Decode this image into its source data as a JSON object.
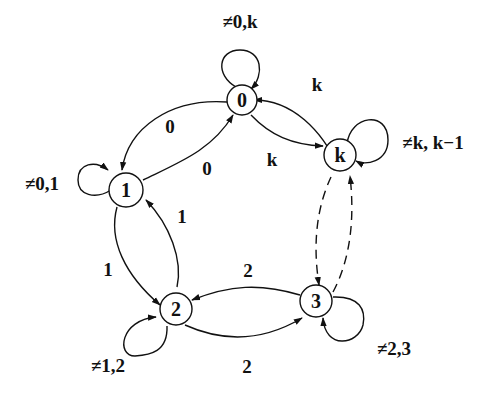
{
  "diagram": {
    "type": "state-transition-graph",
    "nodes": [
      {
        "id": "n0",
        "label": "0"
      },
      {
        "id": "n1",
        "label": "1"
      },
      {
        "id": "n2",
        "label": "2"
      },
      {
        "id": "n3",
        "label": "3"
      },
      {
        "id": "nk",
        "label": "k"
      }
    ],
    "edges": [
      {
        "from": "0",
        "to": "1",
        "label": "0"
      },
      {
        "from": "1",
        "to": "0",
        "label": "0"
      },
      {
        "from": "0",
        "to": "k",
        "label": "k"
      },
      {
        "from": "k",
        "to": "0",
        "label": "k"
      },
      {
        "from": "1",
        "to": "2",
        "label": "1"
      },
      {
        "from": "2",
        "to": "1",
        "label": "1"
      },
      {
        "from": "2",
        "to": "3",
        "label": "2"
      },
      {
        "from": "3",
        "to": "2",
        "label": "2"
      },
      {
        "from": "k",
        "to": "3",
        "label": "",
        "style": "dashed"
      },
      {
        "from": "3",
        "to": "k",
        "label": "",
        "style": "dashed"
      }
    ],
    "self_loops": [
      {
        "node": "0",
        "label": "≠0,k"
      },
      {
        "node": "1",
        "label": "≠0,1"
      },
      {
        "node": "2",
        "label": "≠1,2"
      },
      {
        "node": "3",
        "label": "≠2,3"
      },
      {
        "node": "k",
        "label": "≠k, k−1"
      }
    ]
  }
}
